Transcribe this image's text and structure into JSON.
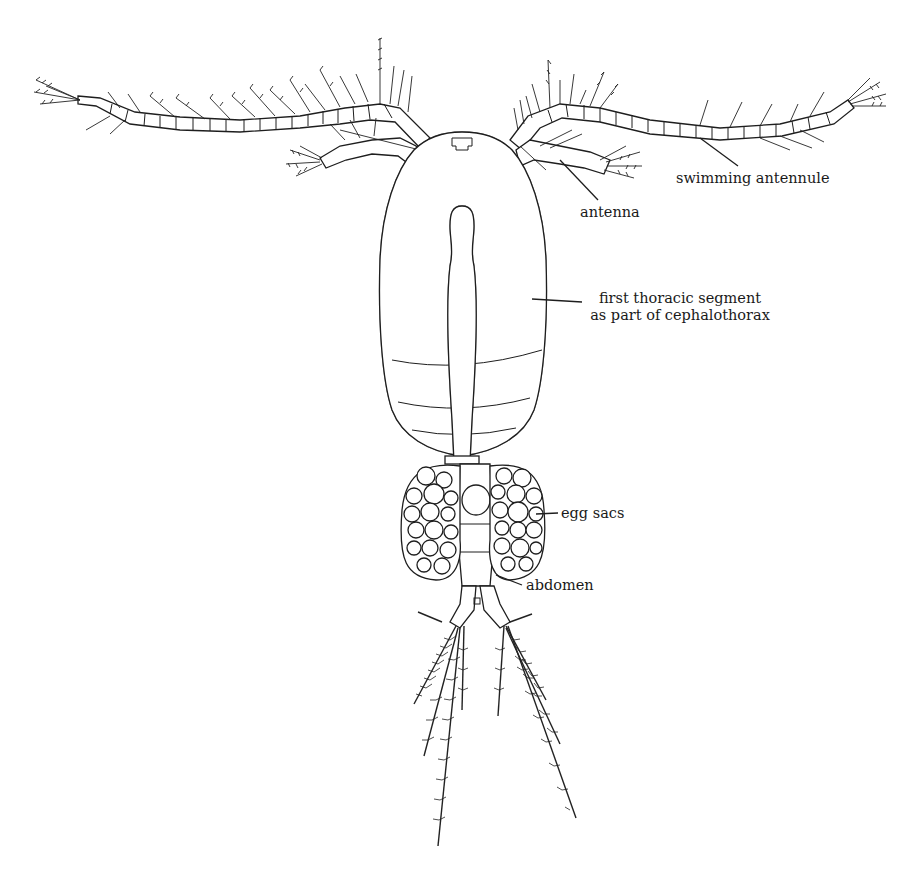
{
  "figure": {
    "background": "#ffffff",
    "ink": "#1e1e1e"
  },
  "labels": {
    "swimming_antennule": "swimming antennule",
    "antenna": "antenna",
    "first_thoracic_line1": "first thoracic segment",
    "first_thoracic_line2": "as part of cephalothorax",
    "egg_sacs": "egg sacs",
    "abdomen": "abdomen"
  }
}
